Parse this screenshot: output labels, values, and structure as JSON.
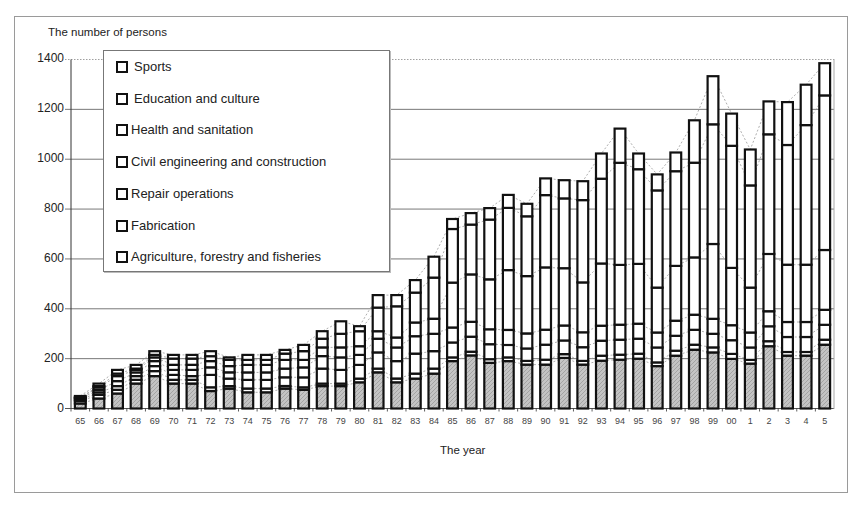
{
  "chart_data": {
    "type": "bar",
    "stacked": true,
    "title": "",
    "ylabel": "The number of persons",
    "xlabel": "The year",
    "ylim": [
      0,
      1400
    ],
    "yticks": [
      0,
      200,
      400,
      600,
      800,
      1000,
      1200,
      1400
    ],
    "grid": true,
    "legend_position": "upper-left inside",
    "categories": [
      "65",
      "66",
      "67",
      "68",
      "69",
      "70",
      "71",
      "72",
      "73",
      "74",
      "75",
      "76",
      "77",
      "78",
      "79",
      "80",
      "81",
      "82",
      "83",
      "84",
      "85",
      "86",
      "87",
      "88",
      "89",
      "90",
      "91",
      "92",
      "93",
      "94",
      "95",
      "96",
      "97",
      "98",
      "99",
      "00",
      "1",
      "2",
      "3",
      "4",
      "5"
    ],
    "series": [
      {
        "name": "Agriculture, forestry and fisheries",
        "values": [
          20,
          40,
          60,
          100,
          130,
          100,
          100,
          70,
          80,
          65,
          65,
          80,
          75,
          90,
          90,
          105,
          145,
          105,
          120,
          140,
          190,
          213,
          183,
          190,
          176,
          176,
          203,
          176,
          192,
          196,
          200,
          170,
          212,
          236,
          225,
          199,
          180,
          250,
          212,
          212,
          256
        ]
      },
      {
        "name": "Fabrication",
        "values": [
          10,
          15,
          15,
          15,
          20,
          15,
          15,
          15,
          10,
          15,
          15,
          10,
          10,
          10,
          10,
          15,
          15,
          15,
          20,
          20,
          15,
          15,
          15,
          15,
          15,
          20,
          15,
          15,
          20,
          20,
          20,
          15,
          20,
          20,
          20,
          20,
          15,
          20,
          15,
          15,
          20
        ]
      },
      {
        "name": "Repair operations",
        "values": [
          5,
          10,
          15,
          15,
          20,
          20,
          15,
          50,
          30,
          35,
          35,
          35,
          40,
          60,
          55,
          55,
          65,
          70,
          80,
          70,
          60,
          60,
          60,
          50,
          50,
          60,
          55,
          55,
          60,
          60,
          60,
          60,
          60,
          60,
          55,
          55,
          50,
          60,
          60,
          60,
          60
        ]
      },
      {
        "name": "Civil engineering and construction",
        "values": [
          5,
          10,
          20,
          15,
          20,
          20,
          25,
          30,
          25,
          30,
          30,
          35,
          40,
          50,
          50,
          40,
          55,
          55,
          70,
          70,
          60,
          60,
          60,
          60,
          60,
          60,
          60,
          60,
          60,
          60,
          60,
          60,
          60,
          60,
          60,
          60,
          60,
          60,
          60,
          60,
          60
        ]
      },
      {
        "name": "Health and sanitation",
        "values": [
          3,
          10,
          20,
          10,
          15,
          20,
          20,
          25,
          25,
          30,
          30,
          35,
          30,
          35,
          40,
          35,
          30,
          40,
          55,
          60,
          180,
          190,
          200,
          240,
          230,
          250,
          230,
          200,
          250,
          240,
          240,
          180,
          220,
          230,
          300,
          230,
          180,
          230,
          230,
          230,
          240
        ]
      },
      {
        "name": "Education and culture",
        "values": [
          2,
          5,
          10,
          5,
          10,
          25,
          25,
          20,
          25,
          20,
          20,
          25,
          35,
          35,
          55,
          60,
          95,
          125,
          120,
          165,
          215,
          200,
          240,
          250,
          240,
          290,
          280,
          330,
          340,
          410,
          380,
          390,
          380,
          380,
          480,
          490,
          410,
          480,
          480,
          560,
          620
        ]
      },
      {
        "name": "Sports",
        "values": [
          5,
          10,
          15,
          15,
          15,
          15,
          15,
          20,
          10,
          20,
          20,
          15,
          25,
          30,
          50,
          20,
          50,
          45,
          50,
          84,
          40,
          46,
          46,
          52,
          50,
          67,
          73,
          76,
          101,
          137,
          63,
          64,
          75,
          170,
          193,
          129,
          144,
          132,
          172,
          162,
          129
        ]
      }
    ],
    "totals": [
      50,
      100,
      155,
      175,
      230,
      215,
      215,
      230,
      205,
      215,
      215,
      235,
      255,
      310,
      350,
      385,
      455,
      455,
      515,
      609,
      760,
      784,
      804,
      857,
      821,
      923,
      916,
      912,
      1023,
      1123,
      1023,
      939,
      1027,
      1156,
      1273,
      1183,
      1039,
      1232,
      1229,
      1289,
      1385
    ]
  },
  "labels": {
    "ytitle": "The number of persons",
    "xtitle": "The year",
    "yticks": [
      "0",
      "200",
      "400",
      "600",
      "800",
      "1000",
      "1200",
      "1400"
    ]
  },
  "legend": {
    "items": [
      {
        "label": "Sports",
        "pad": true
      },
      {
        "label": "Education and culture",
        "pad": true
      },
      {
        "label": "Health and sanitation",
        "pad": false
      },
      {
        "label": "Civil engineering and construction",
        "pad": false
      },
      {
        "label": "Repair operations",
        "pad": false
      },
      {
        "label": "Fabrication",
        "pad": false
      },
      {
        "label": "Agriculture, forestry and fisheries",
        "pad": false
      }
    ]
  },
  "colors": {
    "agriculture_fill": "#bdbdbd",
    "segment_fill": "#ffffff",
    "bar_border": "#111111",
    "grid": "#555555",
    "connector": "#999999"
  }
}
